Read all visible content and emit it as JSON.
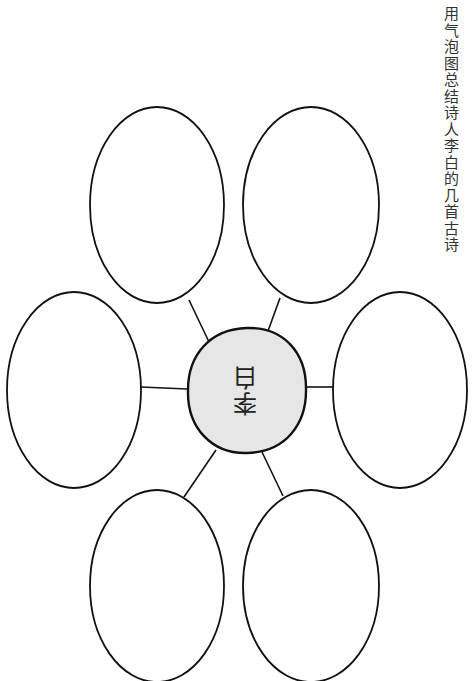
{
  "title": "用气泡图总结诗人李白的几首古诗",
  "center": {
    "label": "李白",
    "fill": "#e6e6e6",
    "stroke": "#111111",
    "cx": 247,
    "cy": 390,
    "r": 60
  },
  "bubbles": [
    {
      "id": "top-left",
      "cx": 157,
      "cy": 205,
      "rx": 67,
      "ry": 98,
      "text": ""
    },
    {
      "id": "top-right",
      "cx": 311,
      "cy": 205,
      "rx": 68,
      "ry": 98,
      "text": ""
    },
    {
      "id": "left",
      "cx": 74,
      "cy": 390,
      "rx": 67,
      "ry": 98,
      "text": ""
    },
    {
      "id": "right",
      "cx": 400,
      "cy": 390,
      "rx": 67,
      "ry": 98,
      "text": ""
    },
    {
      "id": "bottom-left",
      "cx": 157,
      "cy": 586,
      "rx": 67,
      "ry": 96,
      "text": ""
    },
    {
      "id": "bottom-right",
      "cx": 311,
      "cy": 586,
      "rx": 68,
      "ry": 96,
      "text": ""
    }
  ],
  "colors": {
    "stroke": "#111111",
    "background": "#ffffff",
    "title": "#333333"
  }
}
